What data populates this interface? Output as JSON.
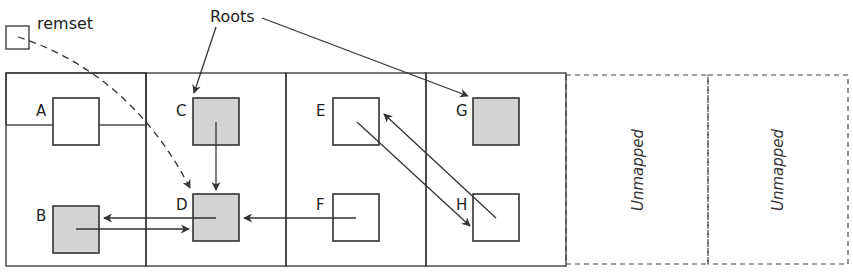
{
  "labels": {
    "remset": "remset",
    "roots": "Roots"
  },
  "regions": [
    {
      "id": "region-1",
      "mapped": true
    },
    {
      "id": "region-2",
      "mapped": true
    },
    {
      "id": "region-3",
      "mapped": true
    },
    {
      "id": "region-4",
      "mapped": true
    },
    {
      "id": "region-5",
      "mapped": false,
      "label": "Unmapped"
    },
    {
      "id": "region-6",
      "mapped": false,
      "label": "Unmapped"
    }
  ],
  "objects": {
    "A": {
      "label": "A",
      "marked": false
    },
    "B": {
      "label": "B",
      "marked": true
    },
    "C": {
      "label": "C",
      "marked": true
    },
    "D": {
      "label": "D",
      "marked": true
    },
    "E": {
      "label": "E",
      "marked": false
    },
    "F": {
      "label": "F",
      "marked": false
    },
    "G": {
      "label": "G",
      "marked": true
    },
    "H": {
      "label": "H",
      "marked": false
    }
  },
  "edges": [
    {
      "from": "Roots",
      "to": "C"
    },
    {
      "from": "Roots",
      "to": "G"
    },
    {
      "from": "remset",
      "to": "D",
      "style": "dashed"
    },
    {
      "from": "C",
      "to": "D"
    },
    {
      "from": "B",
      "to": "D"
    },
    {
      "from": "D",
      "to": "B"
    },
    {
      "from": "F",
      "to": "D"
    },
    {
      "from": "E",
      "to": "H"
    },
    {
      "from": "H",
      "to": "E"
    }
  ],
  "colors": {
    "stroke": "#333333",
    "marked_fill": "#d4d4d4",
    "unmarked_fill": "#ffffff"
  }
}
